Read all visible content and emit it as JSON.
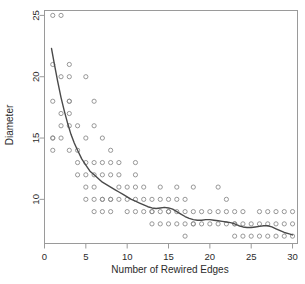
{
  "chart_data": {
    "type": "scatter",
    "title": "",
    "xlabel": "Number of Rewired Edges",
    "ylabel": "Diameter",
    "xlim": [
      0,
      30.6
    ],
    "ylim": [
      6.4,
      25.4
    ],
    "xticks": [
      0,
      5,
      10,
      15,
      20,
      25,
      30
    ],
    "yticks": [
      10,
      15,
      20,
      25
    ],
    "xticklabels": [
      "0",
      "5",
      "10",
      "15",
      "20",
      "25",
      "30"
    ],
    "yticklabels": [
      "10",
      "15",
      "20",
      "25"
    ],
    "grid": false,
    "legend": null,
    "point_marker": "open-circle",
    "point_color": "#8c8c8c",
    "point_radius_px": 2.1,
    "line_color": "#4a4a4a",
    "box_color": "#9a9a9a",
    "points": [
      [
        1,
        25
      ],
      [
        2,
        25
      ],
      [
        1,
        21
      ],
      [
        3,
        21
      ],
      [
        2,
        20
      ],
      [
        3,
        20
      ],
      [
        5,
        20
      ],
      [
        1,
        18
      ],
      [
        3,
        18
      ],
      [
        3,
        18
      ],
      [
        6,
        18
      ],
      [
        2,
        17
      ],
      [
        3,
        17
      ],
      [
        2,
        16
      ],
      [
        3,
        16
      ],
      [
        4,
        16
      ],
      [
        6,
        16
      ],
      [
        1,
        15
      ],
      [
        1,
        15
      ],
      [
        2,
        15
      ],
      [
        5,
        15
      ],
      [
        7,
        15
      ],
      [
        1,
        14
      ],
      [
        3,
        14
      ],
      [
        4,
        14
      ],
      [
        8,
        14
      ],
      [
        4,
        13
      ],
      [
        5,
        13
      ],
      [
        6,
        13
      ],
      [
        7,
        13
      ],
      [
        8,
        13
      ],
      [
        9,
        13
      ],
      [
        11,
        13
      ],
      [
        4,
        12
      ],
      [
        5,
        12
      ],
      [
        6,
        12
      ],
      [
        7,
        12
      ],
      [
        8,
        12
      ],
      [
        9,
        12
      ],
      [
        11,
        12
      ],
      [
        5,
        11
      ],
      [
        6,
        11
      ],
      [
        9,
        11
      ],
      [
        10,
        11
      ],
      [
        11,
        11
      ],
      [
        12,
        11
      ],
      [
        14,
        11
      ],
      [
        16,
        11
      ],
      [
        18,
        11
      ],
      [
        21,
        11
      ],
      [
        5,
        10
      ],
      [
        6,
        10
      ],
      [
        7,
        10
      ],
      [
        7,
        10
      ],
      [
        8,
        10
      ],
      [
        8,
        10
      ],
      [
        9,
        10
      ],
      [
        10,
        10
      ],
      [
        11,
        10
      ],
      [
        12,
        10
      ],
      [
        13,
        10
      ],
      [
        14,
        10
      ],
      [
        15,
        10
      ],
      [
        16,
        10
      ],
      [
        17,
        10
      ],
      [
        22,
        10
      ],
      [
        6,
        9
      ],
      [
        7,
        9
      ],
      [
        8,
        9
      ],
      [
        10,
        9
      ],
      [
        11,
        9
      ],
      [
        12,
        9
      ],
      [
        13,
        9
      ],
      [
        13,
        9
      ],
      [
        14,
        9
      ],
      [
        15,
        9
      ],
      [
        15,
        9
      ],
      [
        16,
        9
      ],
      [
        17,
        9
      ],
      [
        18,
        9
      ],
      [
        19,
        9
      ],
      [
        20,
        9
      ],
      [
        21,
        9
      ],
      [
        22,
        9
      ],
      [
        23,
        9
      ],
      [
        24,
        9
      ],
      [
        26,
        9
      ],
      [
        27,
        9
      ],
      [
        28,
        9
      ],
      [
        29,
        9
      ],
      [
        30,
        9
      ],
      [
        13,
        8
      ],
      [
        14,
        8
      ],
      [
        15,
        8
      ],
      [
        16,
        8
      ],
      [
        17,
        8
      ],
      [
        18,
        8
      ],
      [
        18,
        8
      ],
      [
        19,
        8
      ],
      [
        20,
        8
      ],
      [
        21,
        8
      ],
      [
        22,
        8
      ],
      [
        23,
        8
      ],
      [
        23,
        8
      ],
      [
        24,
        8
      ],
      [
        25,
        8
      ],
      [
        26,
        8
      ],
      [
        27,
        8
      ],
      [
        28,
        8
      ],
      [
        29,
        8
      ],
      [
        30,
        8
      ],
      [
        17,
        7
      ],
      [
        23,
        7
      ],
      [
        24,
        7
      ],
      [
        25,
        7
      ],
      [
        26,
        7
      ],
      [
        27,
        7
      ],
      [
        28,
        7
      ],
      [
        29,
        7
      ],
      [
        30,
        7
      ]
    ],
    "fit_line": [
      [
        0.85,
        22.3
      ],
      [
        1.2,
        21.0
      ],
      [
        1.6,
        19.6
      ],
      [
        2.0,
        18.3
      ],
      [
        2.4,
        17.2
      ],
      [
        2.8,
        16.2
      ],
      [
        3.2,
        15.3
      ],
      [
        3.6,
        14.6
      ],
      [
        4.0,
        14.0
      ],
      [
        4.5,
        13.3
      ],
      [
        5.0,
        12.8
      ],
      [
        5.5,
        12.3
      ],
      [
        6.0,
        12.0
      ],
      [
        6.5,
        11.7
      ],
      [
        7.0,
        11.4
      ],
      [
        7.5,
        11.2
      ],
      [
        8.0,
        11.0
      ],
      [
        8.5,
        10.8
      ],
      [
        9.0,
        10.6
      ],
      [
        9.5,
        10.4
      ],
      [
        10.0,
        10.2
      ],
      [
        10.5,
        10.0
      ],
      [
        11.0,
        9.85
      ],
      [
        11.5,
        9.7
      ],
      [
        12.0,
        9.55
      ],
      [
        12.5,
        9.4
      ],
      [
        13.0,
        9.3
      ],
      [
        13.5,
        9.25
      ],
      [
        14.0,
        9.3
      ],
      [
        14.5,
        9.35
      ],
      [
        15.0,
        9.3
      ],
      [
        15.5,
        9.2
      ],
      [
        16.0,
        9.0
      ],
      [
        16.5,
        8.8
      ],
      [
        17.0,
        8.6
      ],
      [
        17.5,
        8.45
      ],
      [
        18.0,
        8.35
      ],
      [
        18.5,
        8.3
      ],
      [
        19.0,
        8.3
      ],
      [
        19.5,
        8.35
      ],
      [
        20.0,
        8.35
      ],
      [
        20.5,
        8.3
      ],
      [
        21.0,
        8.25
      ],
      [
        21.5,
        8.2
      ],
      [
        22.0,
        8.15
      ],
      [
        22.5,
        8.1
      ],
      [
        23.0,
        8.0
      ],
      [
        23.5,
        7.85
      ],
      [
        24.0,
        7.75
      ],
      [
        24.5,
        7.7
      ],
      [
        25.0,
        7.7
      ],
      [
        25.5,
        7.75
      ],
      [
        26.0,
        7.8
      ],
      [
        26.5,
        7.85
      ],
      [
        27.0,
        7.85
      ],
      [
        27.5,
        7.75
      ],
      [
        28.0,
        7.6
      ],
      [
        28.5,
        7.45
      ],
      [
        29.0,
        7.3
      ],
      [
        29.5,
        7.2
      ],
      [
        30.0,
        7.1
      ]
    ]
  }
}
